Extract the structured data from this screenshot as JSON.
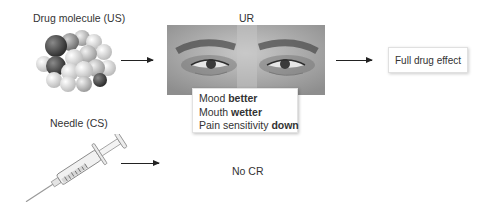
{
  "diagram": {
    "stimuli": {
      "us": {
        "label": "Drug molecule (US)",
        "icon": "molecule-icon"
      },
      "cs": {
        "label": "Needle (CS)",
        "icon": "syringe-icon"
      }
    },
    "response": {
      "label": "UR",
      "image": "face-eyes-image",
      "effects": [
        {
          "prefix": "Mood ",
          "emphasis": "better"
        },
        {
          "prefix": "Mouth ",
          "emphasis": "wetter"
        },
        {
          "prefix": "Pain sensitivity ",
          "emphasis": "down"
        }
      ]
    },
    "outcomes": {
      "us_outcome": "Full drug effect",
      "cs_outcome": "No CR"
    },
    "arrows": [
      {
        "from": "Drug molecule (US)",
        "to": "UR"
      },
      {
        "from": "UR",
        "to": "Full drug effect"
      },
      {
        "from": "Needle (CS)",
        "to": "No CR"
      }
    ]
  }
}
